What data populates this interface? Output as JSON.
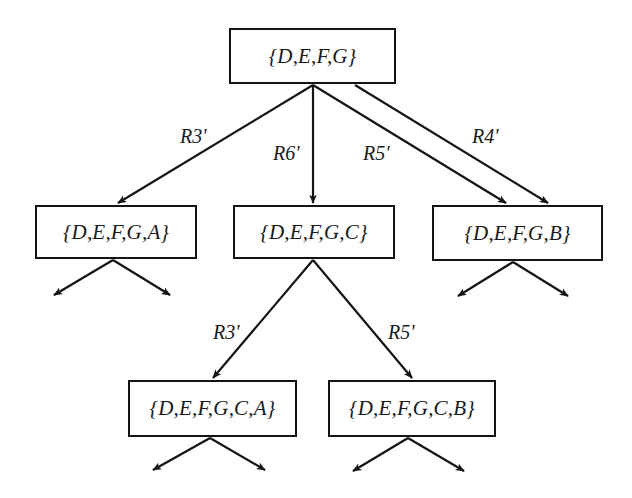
{
  "diagram": {
    "type": "search-tree",
    "nodes": [
      {
        "id": "root",
        "label": "{D,E,F,G}",
        "box": [
          229,
          28,
          396,
          84
        ]
      },
      {
        "id": "n_a",
        "label": "{D,E,F,G,A}",
        "box": [
          35,
          205,
          197,
          259
        ]
      },
      {
        "id": "n_c",
        "label": "{D,E,F,G,C}",
        "box": [
          233,
          205,
          395,
          259
        ]
      },
      {
        "id": "n_b",
        "label": "{D,E,F,G,B}",
        "box": [
          432,
          205,
          603,
          261
        ]
      },
      {
        "id": "n_ca",
        "label": "{D,E,F,G,C,A}",
        "box": [
          128,
          380,
          297,
          437
        ]
      },
      {
        "id": "n_cb",
        "label": "{D,E,F,G,C,B}",
        "box": [
          328,
          380,
          496,
          437
        ]
      }
    ],
    "edges": [
      {
        "from": "root",
        "to": "n_a",
        "label": "R3'"
      },
      {
        "from": "root",
        "to": "n_c",
        "label": "R6'"
      },
      {
        "from": "root",
        "to": "n_b",
        "label": "R5'"
      },
      {
        "from": "root",
        "to": "n_b",
        "label": "R4'"
      },
      {
        "from": "n_c",
        "to": "n_ca",
        "label": "R3'"
      },
      {
        "from": "n_c",
        "to": "n_cb",
        "label": "R5'"
      }
    ],
    "continuation_stubs": "each leaf node has two outgoing unlabeled arrows (further expansion)"
  },
  "labels": {
    "root": "{D,E,F,G}",
    "n_a": "{D,E,F,G,A}",
    "n_c": "{D,E,F,G,C}",
    "n_b": "{D,E,F,G,B}",
    "n_ca": "{D,E,F,G,C,A}",
    "n_cb": "{D,E,F,G,C,B}",
    "edge_r3_top": "R3'",
    "edge_r6_top": "R6'",
    "edge_r5_top": "R5'",
    "edge_r4_top": "R4'",
    "edge_r3_bottom": "R3'",
    "edge_r5_bottom": "R5'"
  }
}
